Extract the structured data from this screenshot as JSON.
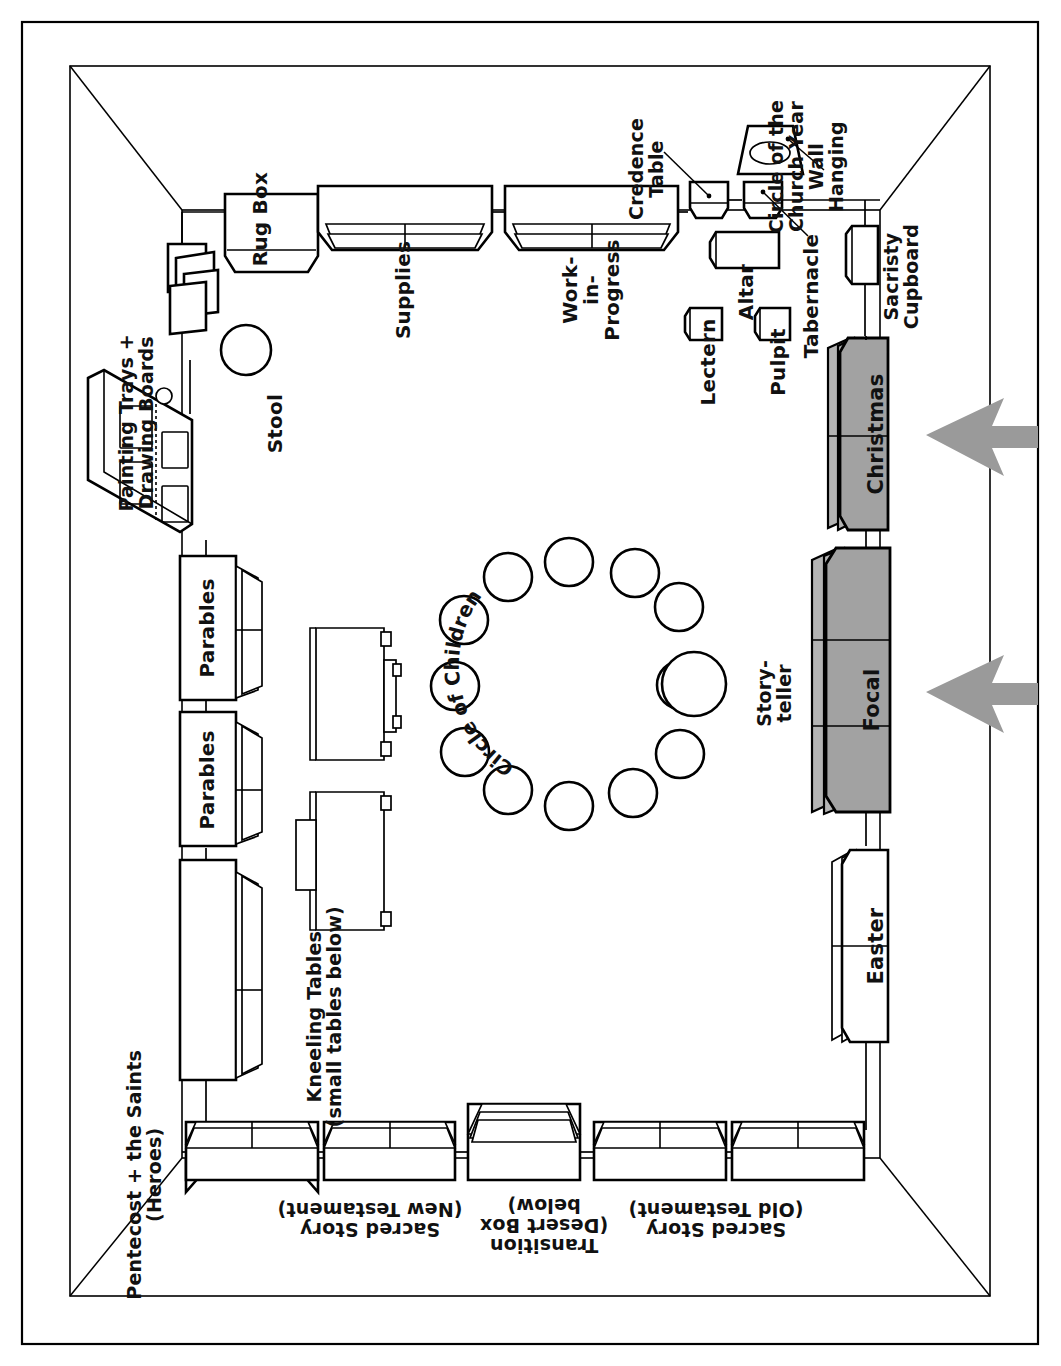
{
  "diagram": {
    "type": "floor-plan",
    "orientation_note": "labels rendered rotated 90 deg (left wall reading) and 180 deg (bottom wall)",
    "colors": {
      "ink": "#000000",
      "paper": "#ffffff",
      "shaded_shelf_fill": "#a2a2a2",
      "shaded_shelf_side": "#b9b9b9",
      "arrow_fill": "#9a9a9a"
    }
  },
  "room": {
    "name": "room-outline",
    "walls": [
      "top",
      "right",
      "bottom",
      "left"
    ]
  },
  "furniture": {
    "top_wall": [
      {
        "id": "rug-box",
        "label": "Rug Box"
      },
      {
        "id": "supplies",
        "label": "Supplies"
      },
      {
        "id": "work-in-progress",
        "label": "Work-\nin-\nProgress"
      },
      {
        "id": "credence-table",
        "label": "Credence\nTable"
      }
    ],
    "top_right_cluster": [
      {
        "id": "circle-of-the-church-year-wall-hanging",
        "label": "Circle of the\nChurch Year\nWall\nHanging"
      },
      {
        "id": "tabernacle",
        "label": "Tabernacle"
      },
      {
        "id": "altar",
        "label": "Altar"
      },
      {
        "id": "lectern",
        "label": "Lectern"
      },
      {
        "id": "pulpit",
        "label": "Pulpit"
      },
      {
        "id": "sacristy-cupboard",
        "label": "Sacristy\nCupboard"
      }
    ],
    "right_wall": [
      {
        "id": "christmas",
        "label": "Christmas",
        "shaded": true,
        "arrow": true
      },
      {
        "id": "focal",
        "label": "Focal",
        "shaded": true,
        "arrow": true
      },
      {
        "id": "easter",
        "label": "Easter",
        "shaded": false,
        "arrow": false
      }
    ],
    "bottom_wall": [
      {
        "id": "sacred-story-new-testament",
        "label": "Sacred Story\n(New Testament)"
      },
      {
        "id": "transition-desert-box",
        "label": "Transition\n(Desert Box\nbelow)"
      },
      {
        "id": "sacred-story-old-testament",
        "label": "Sacred Story\n(Old Testament)"
      }
    ],
    "left_wall": [
      {
        "id": "pentecost-and-the-saints",
        "label": "Pentecost + the Saints\n(Heroes)"
      },
      {
        "id": "parables-lower",
        "label": "Parables"
      },
      {
        "id": "parables-upper",
        "label": "Parables"
      }
    ],
    "top_left_cluster": [
      {
        "id": "door",
        "label": ""
      },
      {
        "id": "painting-trays-drawing-boards",
        "label": "Painting Trays +\nDrawing Boards"
      },
      {
        "id": "stool",
        "label": "Stool"
      }
    ],
    "center": [
      {
        "id": "kneeling-tables",
        "label": "Kneeling Tables\n(small tables below)"
      },
      {
        "id": "circle-of-children",
        "label": "Circle of Children",
        "seat_count": 12
      },
      {
        "id": "storyteller",
        "label": "Story-\nteller"
      }
    ]
  },
  "labels": {
    "rug_box": "Rug Box",
    "supplies": "Supplies",
    "work_in_progress": "Work-\nin-\nProgress",
    "credence_table": "Credence\nTable",
    "circle_church_year": "Circle of the\nChurch Year\nWall\nHanging",
    "tabernacle": "Tabernacle",
    "altar": "Altar",
    "lectern": "Lectern",
    "pulpit": "Pulpit",
    "sacristy_cupboard": "Sacristy\nCupboard",
    "christmas": "Christmas",
    "focal": "Focal",
    "easter": "Easter",
    "sacred_story_nt": "Sacred Story\n(New Testament)",
    "transition": "Transition\n(Desert Box\nbelow)",
    "sacred_story_ot": "Sacred Story\n(Old Testament)",
    "pentecost": "Pentecost + the Saints\n(Heroes)",
    "parables_1": "Parables",
    "parables_2": "Parables",
    "painting_trays": "Painting Trays +\nDrawing Boards",
    "stool": "Stool",
    "kneeling_tables": "Kneeling Tables\n(small tables below)",
    "circle_of_children": "Circle of Children",
    "storyteller": "Story-\nteller"
  }
}
